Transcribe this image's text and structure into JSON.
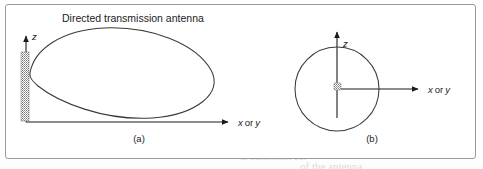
{
  "figure": {
    "title": "Directed transmission antenna",
    "panels": [
      {
        "id": "a",
        "caption": "(a)",
        "pattern": "teardrop-lobe",
        "vertical_axis_label": "z",
        "horizontal_axis_label_x": "x",
        "horizontal_axis_label_or": "or",
        "horizontal_axis_label_y": "y",
        "antenna_marker": "hatched-vertical-bar"
      },
      {
        "id": "b",
        "caption": "(b)",
        "pattern": "circle-omnidirectional",
        "vertical_axis_label": "z",
        "horizontal_axis_label_x": "x",
        "horizontal_axis_label_or": "or",
        "horizontal_axis_label_y": "y",
        "antenna_marker": "hatched-square"
      }
    ],
    "colors": {
      "ink": "#1b1b1b",
      "curve": "#3a3a3a",
      "frame": "#9a9a9a",
      "hatch": "#8f8f8f",
      "background": "#ffffff",
      "ghost_text": "#d9d4cf"
    }
  },
  "bleed_through": {
    "lines": [
      {
        "text": "the transmitted signal",
        "x": 250,
        "y": 14
      },
      {
        "text": "nt of the bandwidth",
        "x": 256,
        "y": 26
      },
      {
        "text": "a rise to the signal",
        "x": 258,
        "y": 36
      },
      {
        "text": "is greater than",
        "x": 262,
        "y": 47
      },
      {
        "text": "with a minimum of signal",
        "x": 250,
        "y": 58
      },
      {
        "text": "is a practical approach",
        "x": 246,
        "y": 68
      },
      {
        "text": "the inherent directional",
        "x": 248,
        "y": 79
      },
      {
        "text": "wave antenna is",
        "x": 252,
        "y": 90
      },
      {
        "text": "antennas that can",
        "x": 256,
        "y": 100
      },
      {
        "text": "of the spectrum",
        "x": 258,
        "y": 112
      },
      {
        "text": "its low cost",
        "x": 264,
        "y": 124
      },
      {
        "text": "between the transmit",
        "x": 30,
        "y": 60
      },
      {
        "text": "signal strength of a",
        "x": 34,
        "y": 72
      },
      {
        "text": "is reduced to the",
        "x": 38,
        "y": 84
      },
      {
        "text": "and the shape",
        "x": 120,
        "y": 96
      },
      {
        "text": "the received power",
        "x": 30,
        "y": 146
      },
      {
        "text": "is sufficient for",
        "x": 240,
        "y": 150
      },
      {
        "text": "of the antenna",
        "x": 300,
        "y": 160
      }
    ]
  }
}
